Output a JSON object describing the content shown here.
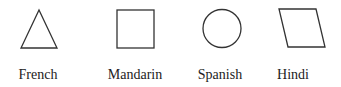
{
  "figure": {
    "stroke_color": "#333333",
    "background": "#ffffff",
    "items": [
      {
        "shape": "triangle-icon",
        "label": "French"
      },
      {
        "shape": "square-icon",
        "label": "Mandarin"
      },
      {
        "shape": "circle-icon",
        "label": "Spanish"
      },
      {
        "shape": "parallelogram-icon",
        "label": "Hindi"
      }
    ]
  }
}
